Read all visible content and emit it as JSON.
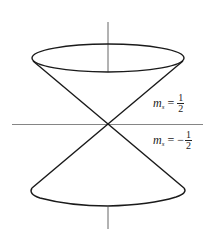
{
  "figure": {
    "colors": {
      "stroke": "#1a1a1a",
      "axis": "#555555",
      "background": "#ffffff"
    },
    "labels": {
      "upper": {
        "symbol": "m",
        "subscript": "s",
        "equals": "=",
        "sign": "",
        "numerator": "1",
        "denominator": "2"
      },
      "lower": {
        "symbol": "m",
        "subscript": "s",
        "equals": "=",
        "sign": "−",
        "numerator": "1",
        "denominator": "2"
      }
    }
  }
}
